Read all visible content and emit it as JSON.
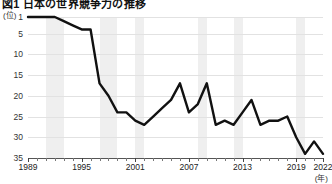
{
  "chart": {
    "title": "図1 日本の世界競争力の推移",
    "y_unit": "(位)",
    "x_unit": "(年)"
  },
  "chart_data": {
    "type": "line",
    "title": "図1 日本の世界競争力の推移",
    "xlabel": "(年)",
    "ylabel": "(位)",
    "ylim": [
      1,
      35
    ],
    "y_inverted": true,
    "yticks": [
      1,
      5,
      10,
      15,
      20,
      25,
      30,
      35
    ],
    "xlim": [
      1989,
      2022
    ],
    "xticks": [
      1989,
      1995,
      2001,
      2007,
      2013,
      2019,
      2022
    ],
    "grid": true,
    "legend": "none",
    "shaded_bands": [
      {
        "start": 1991,
        "end": 1993
      },
      {
        "start": 1997,
        "end": 1999
      },
      {
        "start": 2001,
        "end": 2002
      },
      {
        "start": 2008,
        "end": 2009
      },
      {
        "start": 2012,
        "end": 2013
      },
      {
        "start": 2019,
        "end": 2020
      }
    ],
    "x": [
      1989,
      1990,
      1991,
      1992,
      1993,
      1994,
      1995,
      1996,
      1997,
      1998,
      1999,
      2000,
      2001,
      2002,
      2003,
      2004,
      2005,
      2006,
      2007,
      2008,
      2009,
      2010,
      2011,
      2012,
      2013,
      2014,
      2015,
      2016,
      2017,
      2018,
      2019,
      2020,
      2021,
      2022
    ],
    "values": [
      1,
      1,
      1,
      1,
      2,
      3,
      4,
      4,
      17,
      20,
      24,
      24,
      26,
      27,
      25,
      23,
      21,
      17,
      24,
      22,
      17,
      27,
      26,
      27,
      24,
      21,
      27,
      26,
      26,
      25,
      30,
      34,
      31,
      34
    ],
    "series": [
      {
        "name": "日本の総合順位",
        "values": [
          1,
          1,
          1,
          1,
          2,
          3,
          4,
          4,
          17,
          20,
          24,
          24,
          26,
          27,
          25,
          23,
          21,
          17,
          24,
          22,
          17,
          27,
          26,
          27,
          24,
          21,
          27,
          26,
          26,
          25,
          30,
          34,
          31,
          34
        ]
      }
    ]
  }
}
